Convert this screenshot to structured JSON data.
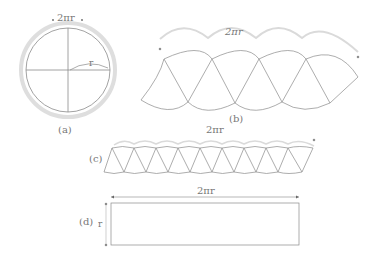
{
  "figure": {
    "panels": [
      {
        "id": "a",
        "label": "(a)",
        "measure_label": "2πr",
        "radius_label": "r",
        "description": "circle divided into quadrants with outer circumference ring"
      },
      {
        "id": "b",
        "label": "(b)",
        "measure_label": "2πr",
        "description": "circle cut into sectors arranged alternately (4 pairs)"
      },
      {
        "id": "c",
        "label": "(c)",
        "measure_label": "2πr",
        "description": "finer sectors arranged alternately (9 pairs)"
      },
      {
        "id": "d",
        "label": "(d)",
        "measure_label": "2πr",
        "height_label": "r",
        "description": "limiting rectangle with width 2πr and height r"
      }
    ],
    "colors": {
      "stroke": "#8a8a8a",
      "ring": "#d8d8d8",
      "text": "#777777"
    }
  }
}
